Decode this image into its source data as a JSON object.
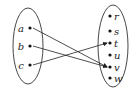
{
  "diagram": {
    "type": "function-mapping",
    "domain_set": {
      "elements": [
        {
          "label": "a",
          "x": 30,
          "y": 28
        },
        {
          "label": "b",
          "x": 30,
          "y": 46
        },
        {
          "label": "c",
          "x": 30,
          "y": 65
        }
      ]
    },
    "codomain_set": {
      "elements": [
        {
          "label": "r",
          "x": 110,
          "y": 16
        },
        {
          "label": "s",
          "x": 110,
          "y": 31
        },
        {
          "label": "t",
          "x": 110,
          "y": 43
        },
        {
          "label": "u",
          "x": 110,
          "y": 55
        },
        {
          "label": "v",
          "x": 110,
          "y": 67
        },
        {
          "label": "w",
          "x": 110,
          "y": 78
        }
      ]
    },
    "mappings": [
      {
        "from": "a",
        "to": "v"
      },
      {
        "from": "b",
        "to": "v"
      },
      {
        "from": "c",
        "to": "t"
      }
    ]
  }
}
